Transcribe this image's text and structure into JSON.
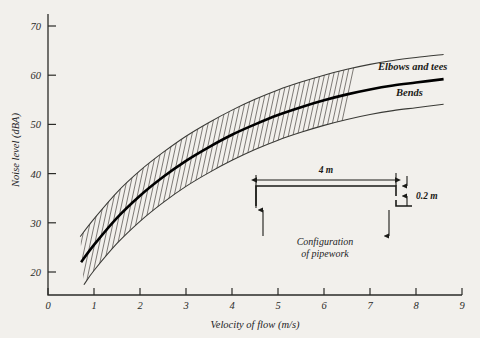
{
  "chart_data": {
    "type": "line",
    "title": "",
    "xlabel": "Velocity of flow (m/s)",
    "ylabel": "Noise level (dBA)",
    "xlim": [
      0,
      9
    ],
    "ylim": [
      14,
      73
    ],
    "grid": false,
    "legend_position": "inline-right-end",
    "x_ticks": [
      "0",
      "1",
      "2",
      "3",
      "4",
      "5",
      "6",
      "7",
      "8",
      "9"
    ],
    "y_ticks": [
      "20",
      "30",
      "40",
      "50",
      "60",
      "70"
    ],
    "x_tick_values": [
      0,
      1,
      2,
      3,
      4,
      5,
      6,
      7,
      8,
      9
    ],
    "y_tick_values": [
      20,
      30,
      40,
      50,
      60,
      70
    ],
    "band_shading": "diagonal-hatch",
    "band_hatch_x_end": 4.0,
    "series": [
      {
        "name": "Elbows and tees",
        "style": "thin",
        "x": [
          0.7,
          1.0,
          1.5,
          2.0,
          2.5,
          3.0,
          3.5,
          4.0,
          4.5,
          5.0,
          5.5,
          6.0,
          6.5,
          7.0,
          7.5,
          8.0,
          8.6
        ],
        "values": [
          27.2,
          30.8,
          36.2,
          40.6,
          44.3,
          47.6,
          50.4,
          52.9,
          55.1,
          57.0,
          58.6,
          60.0,
          61.2,
          62.2,
          63.0,
          63.6,
          64.2
        ]
      },
      {
        "name": "Bends",
        "style": "bold",
        "x": [
          0.72,
          1.0,
          1.5,
          2.0,
          2.5,
          3.0,
          3.5,
          4.0,
          4.5,
          5.0,
          5.5,
          6.0,
          6.5,
          7.0,
          7.5,
          8.0,
          8.6
        ],
        "values": [
          22.0,
          25.5,
          31.0,
          35.5,
          39.3,
          42.6,
          45.4,
          47.9,
          50.0,
          51.9,
          53.5,
          54.9,
          56.1,
          57.1,
          57.9,
          58.5,
          59.2
        ]
      },
      {
        "name": "lower-bound",
        "style": "thin",
        "x": [
          0.78,
          1.0,
          1.5,
          2.0,
          2.5,
          3.0,
          3.5,
          4.0,
          4.5,
          5.0,
          5.5,
          6.0,
          6.5,
          7.0,
          7.5,
          8.0,
          8.6
        ],
        "values": [
          17.4,
          20.3,
          25.8,
          30.3,
          34.1,
          37.4,
          40.2,
          42.7,
          44.9,
          46.8,
          48.4,
          49.8,
          51.0,
          52.0,
          52.8,
          53.4,
          54.1
        ]
      }
    ],
    "annotations": [
      {
        "name": "elbows-and-tees-label",
        "text": "Elbows and tees"
      },
      {
        "name": "bends-label",
        "text": "Bends"
      }
    ]
  },
  "inset": {
    "name": "pipework-configuration-diagram",
    "horizontal_dimension": "4 m",
    "vertical_dimension": "0.2 m",
    "caption_line_1": "Configuration",
    "caption_line_2": "of pipework"
  },
  "colors": {
    "background": "#f2f0ec",
    "ink": "#1a1a17",
    "line_thin": "#3a3a36",
    "line_bold": "#000000",
    "hatch": "#55524d"
  }
}
